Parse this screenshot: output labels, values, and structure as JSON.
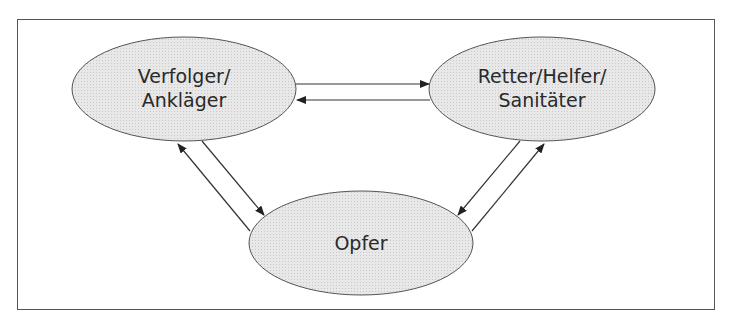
{
  "diagram": {
    "type": "drama-triangle",
    "colors": {
      "node_fill": "#e6e6e6",
      "stroke": "#333333",
      "frame": "#555555"
    },
    "nodes": [
      {
        "id": "persecutor",
        "line1": "Verfolger/",
        "line2": "Ankläger"
      },
      {
        "id": "rescuer",
        "line1": "Retter/Helfer/",
        "line2": "Sanitäter"
      },
      {
        "id": "victim",
        "line1": "Opfer",
        "line2": ""
      }
    ],
    "edges": [
      {
        "from": "persecutor",
        "to": "rescuer"
      },
      {
        "from": "rescuer",
        "to": "persecutor"
      },
      {
        "from": "persecutor",
        "to": "victim"
      },
      {
        "from": "victim",
        "to": "persecutor"
      },
      {
        "from": "rescuer",
        "to": "victim"
      },
      {
        "from": "victim",
        "to": "rescuer"
      }
    ]
  }
}
